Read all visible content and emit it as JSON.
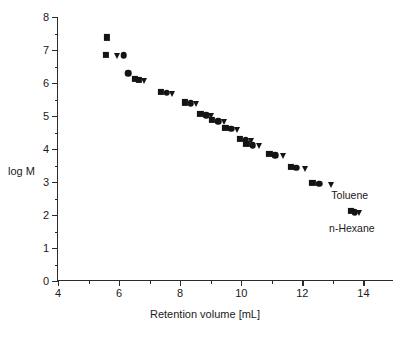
{
  "chart_data": {
    "type": "scatter",
    "title": "",
    "xlabel": "Retention volume [mL]",
    "ylabel": "log M",
    "xlim": [
      4,
      15
    ],
    "ylim": [
      0,
      8
    ],
    "xticks": [
      4,
      6,
      8,
      10,
      12,
      14
    ],
    "xticks_minor": [
      5,
      7,
      9,
      11,
      13
    ],
    "yticks": [
      0,
      1,
      2,
      3,
      4,
      5,
      6,
      7,
      8
    ],
    "yticks_minor": [
      0.5,
      1.5,
      2.5,
      3.5,
      4.5,
      5.5,
      6.5,
      7.5
    ],
    "grid": false,
    "legend": "none",
    "marker_color": "#141414",
    "series": [
      {
        "name": "series-1",
        "marker": "square",
        "points": [
          {
            "x": 5.59,
            "y": 7.38
          },
          {
            "x": 5.56,
            "y": 6.85
          },
          {
            "x": 6.52,
            "y": 6.12
          },
          {
            "x": 6.65,
            "y": 6.09
          },
          {
            "x": 7.38,
            "y": 5.73
          },
          {
            "x": 8.15,
            "y": 5.41
          },
          {
            "x": 8.66,
            "y": 5.06
          },
          {
            "x": 9.05,
            "y": 4.88
          },
          {
            "x": 9.48,
            "y": 4.64
          },
          {
            "x": 9.95,
            "y": 4.3
          },
          {
            "x": 10.17,
            "y": 4.15
          },
          {
            "x": 10.92,
            "y": 3.85
          },
          {
            "x": 11.62,
            "y": 3.45
          },
          {
            "x": 12.33,
            "y": 2.97
          },
          {
            "x": 13.58,
            "y": 2.12
          }
        ]
      },
      {
        "name": "series-2",
        "marker": "circle",
        "points": [
          {
            "x": 6.15,
            "y": 6.85
          },
          {
            "x": 6.3,
            "y": 6.3
          },
          {
            "x": 7.56,
            "y": 5.7
          },
          {
            "x": 8.35,
            "y": 5.38
          },
          {
            "x": 8.85,
            "y": 5.03
          },
          {
            "x": 9.25,
            "y": 4.85
          },
          {
            "x": 9.67,
            "y": 4.61
          },
          {
            "x": 10.15,
            "y": 4.27
          },
          {
            "x": 10.38,
            "y": 4.12
          },
          {
            "x": 11.12,
            "y": 3.82
          },
          {
            "x": 11.8,
            "y": 3.43
          },
          {
            "x": 12.56,
            "y": 2.95
          },
          {
            "x": 13.72,
            "y": 2.09
          }
        ]
      },
      {
        "name": "series-3",
        "marker": "triangle",
        "points": [
          {
            "x": 5.92,
            "y": 6.83
          },
          {
            "x": 6.82,
            "y": 6.06
          },
          {
            "x": 7.72,
            "y": 5.67
          },
          {
            "x": 8.52,
            "y": 5.35
          },
          {
            "x": 9.02,
            "y": 5.0
          },
          {
            "x": 9.43,
            "y": 4.82
          },
          {
            "x": 9.85,
            "y": 4.58
          },
          {
            "x": 10.33,
            "y": 4.24
          },
          {
            "x": 10.58,
            "y": 4.09
          },
          {
            "x": 11.38,
            "y": 3.79
          },
          {
            "x": 12.08,
            "y": 3.4
          },
          {
            "x": 12.95,
            "y": 2.92
          },
          {
            "x": 13.85,
            "y": 2.06
          }
        ]
      }
    ],
    "annotations": [
      {
        "label": "Toluene",
        "x": 13.55,
        "y": 2.62
      },
      {
        "label": "n-Hexane",
        "x": 13.62,
        "y": 1.62
      }
    ]
  }
}
